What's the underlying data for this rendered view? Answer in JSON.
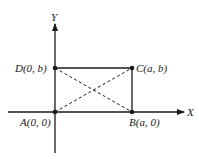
{
  "diagram": {
    "type": "coordinate-rectangle",
    "axes": {
      "x_label": "X",
      "y_label": "Y"
    },
    "points": [
      {
        "id": "A",
        "label": "A(0, 0)",
        "name": "A",
        "coords": "(0, 0)"
      },
      {
        "id": "B",
        "label": "B(a, 0)",
        "name": "B",
        "coords": "(a, 0)"
      },
      {
        "id": "C",
        "label": "C(a, b)",
        "name": "C",
        "coords": "(a, b)"
      },
      {
        "id": "D",
        "label": "D(0, b)",
        "name": "D",
        "coords": "(0, b)"
      }
    ],
    "edges": [
      "AB",
      "BC",
      "CD",
      "DA"
    ],
    "diagonals": [
      "AC",
      "BD"
    ],
    "diagonal_style": "dashed",
    "colors": {
      "line": "#1a1a1a",
      "background": "#ffffff"
    }
  },
  "labels": {
    "x_axis": "X",
    "y_axis": "Y",
    "A": "A(0, 0)",
    "B": "B(a, 0)",
    "C": "C(a, b)",
    "D": "D(0, b)"
  }
}
